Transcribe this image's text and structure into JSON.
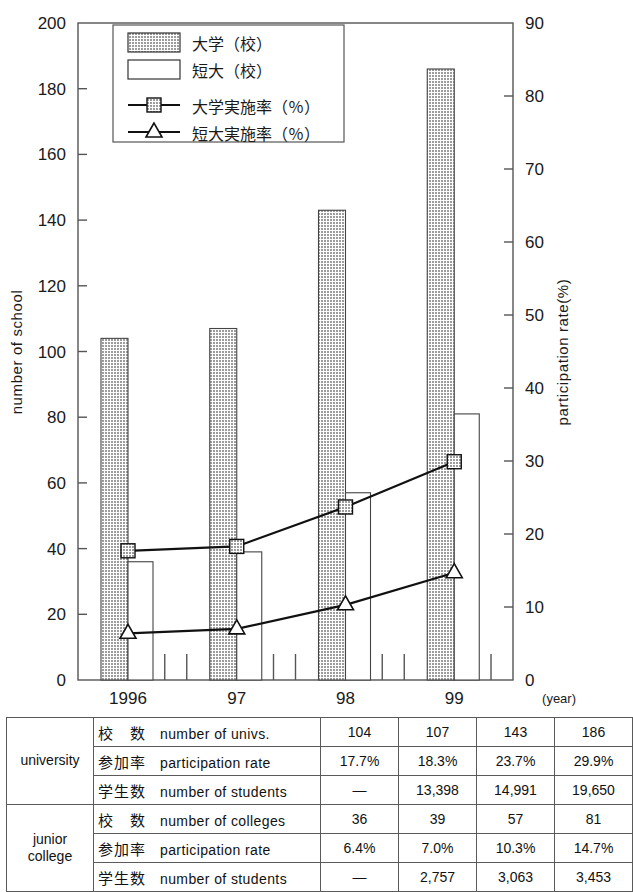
{
  "chart_data": {
    "type": "bar",
    "title": "",
    "categories": [
      "1996",
      "97",
      "98",
      "99"
    ],
    "xlabel": "(year)",
    "ylabel": "number of school",
    "ylabel_right": "participation rate(%)",
    "ylim": [
      0,
      200
    ],
    "ylim_right": [
      0,
      90
    ],
    "yticks": [
      0,
      20,
      40,
      60,
      80,
      100,
      120,
      140,
      160,
      180,
      200
    ],
    "yticks_right": [
      0,
      10,
      20,
      30,
      40,
      50,
      60,
      70,
      80,
      90
    ],
    "grid": false,
    "legend_position": "top-center",
    "series": [
      {
        "name": "大学（校）",
        "kind": "bar",
        "axis": "left",
        "fill": "#b9b9b9",
        "values": [
          104,
          107,
          143,
          186
        ]
      },
      {
        "name": "短大（校）",
        "kind": "bar",
        "axis": "left",
        "fill": "#ffffff",
        "values": [
          36,
          39,
          57,
          81
        ]
      },
      {
        "name": "大学実施率（％）",
        "kind": "line",
        "axis": "right",
        "marker": "square",
        "values": [
          17.7,
          18.3,
          23.7,
          29.9
        ]
      },
      {
        "name": "短大実施率（％）",
        "kind": "line",
        "axis": "right",
        "marker": "triangle",
        "values": [
          6.4,
          7.0,
          10.3,
          14.7
        ]
      }
    ]
  },
  "legend": {
    "items": [
      {
        "label": "大学（校）",
        "type": "swatch-filled"
      },
      {
        "label": "短大（校）",
        "type": "swatch-empty"
      },
      {
        "label": "大学実施率（％）",
        "type": "line-square"
      },
      {
        "label": "短大実施率（％）",
        "type": "line-triangle"
      }
    ]
  },
  "axes": {
    "left_title": "number of school",
    "right_title": "participation rate(%)",
    "left_ticks": [
      "0",
      "20",
      "40",
      "60",
      "80",
      "100",
      "120",
      "140",
      "160",
      "180",
      "200"
    ],
    "right_ticks": [
      "0",
      "10",
      "20",
      "30",
      "40",
      "50",
      "60",
      "70",
      "80",
      "90"
    ],
    "x_ticks": [
      "1996",
      "97",
      "98",
      "99"
    ],
    "x_note": "(year)"
  },
  "table": {
    "groups": [
      {
        "group_label": "university",
        "rows": [
          {
            "jp": "校　数",
            "en": "number of univs.",
            "values": [
              "104",
              "107",
              "143",
              "186"
            ]
          },
          {
            "jp": "参加率",
            "en": "participation rate",
            "values": [
              "17.7%",
              "18.3%",
              "23.7%",
              "29.9%"
            ]
          },
          {
            "jp": "学生数",
            "en": "number of students",
            "values": [
              "—",
              "13,398",
              "14,991",
              "19,650"
            ]
          }
        ]
      },
      {
        "group_label": "junior college",
        "rows": [
          {
            "jp": "校　数",
            "en": "number of colleges",
            "values": [
              "36",
              "39",
              "57",
              "81"
            ]
          },
          {
            "jp": "参加率",
            "en": "participation rate",
            "values": [
              "6.4%",
              "7.0%",
              "10.3%",
              "14.7%"
            ]
          },
          {
            "jp": "学生数",
            "en": "number of students",
            "values": [
              "—",
              "2,757",
              "3,063",
              "3,453"
            ]
          }
        ]
      }
    ]
  },
  "colors": {
    "bar_fill": "#b9b9b9",
    "line": "#111111",
    "axis": "#555555"
  }
}
